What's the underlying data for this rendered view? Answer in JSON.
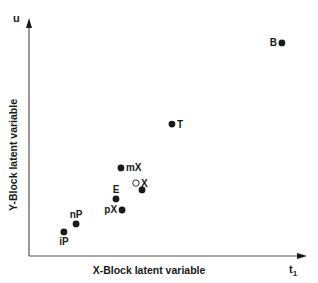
{
  "chart_data": {
    "type": "scatter",
    "title": "",
    "xlabel": "X-Block latent variable",
    "ylabel": "Y-Block latent variable",
    "x_axis_symbol": "t",
    "x_axis_symbol_sub": "1",
    "y_axis_symbol": "u",
    "xlim": [
      0,
      10
    ],
    "ylim": [
      0,
      10
    ],
    "grid": false,
    "legend": null,
    "points": [
      {
        "label": "B",
        "x": 9.13,
        "y": 9.03,
        "marker": "filled",
        "label_pos": "left"
      },
      {
        "label": "T",
        "x": 5.16,
        "y": 5.59,
        "marker": "filled",
        "label_pos": "right"
      },
      {
        "label": "mX",
        "x": 3.32,
        "y": 3.73,
        "marker": "filled",
        "label_pos": "right"
      },
      {
        "label": "X",
        "x": 3.86,
        "y": 3.09,
        "marker": "open",
        "label_pos": "right"
      },
      {
        "label": "",
        "x": 4.08,
        "y": 2.8,
        "marker": "filled",
        "label_pos": "none"
      },
      {
        "label": "E",
        "x": 3.14,
        "y": 2.42,
        "marker": "filled",
        "label_pos": "above"
      },
      {
        "label": "pX",
        "x": 3.36,
        "y": 1.95,
        "marker": "filled",
        "label_pos": "left"
      },
      {
        "label": "nP",
        "x": 1.7,
        "y": 1.36,
        "marker": "filled",
        "label_pos": "above"
      },
      {
        "label": "iP",
        "x": 1.26,
        "y": 1.02,
        "marker": "filled",
        "label_pos": "below"
      }
    ]
  },
  "colors": {
    "ink": "#1a1a1a",
    "axis": "#555555",
    "background": "#ffffff"
  }
}
